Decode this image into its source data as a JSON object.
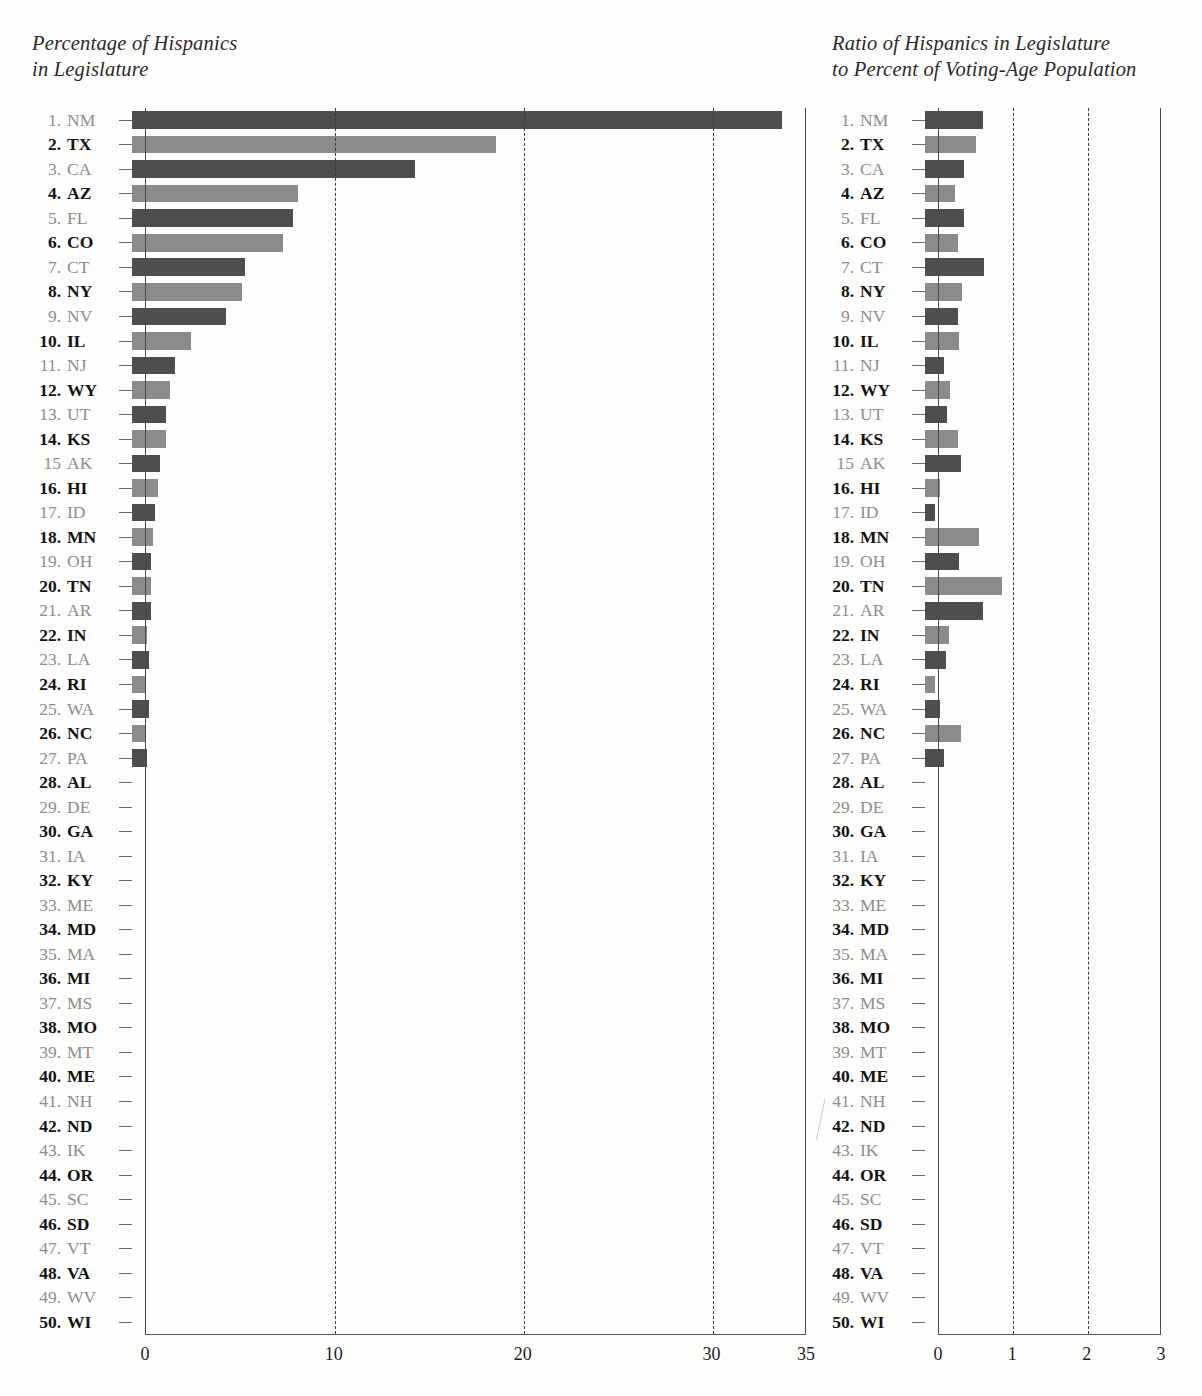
{
  "panels": {
    "left": {
      "title": "Percentage of Hispanics\nin Legislature"
    },
    "right": {
      "title": "Ratio of Hispanics in Legislature\nto Percent of Voting-Age Population"
    }
  },
  "rows": [
    {
      "rank": "1.",
      "abbr": "NM"
    },
    {
      "rank": "2.",
      "abbr": "TX"
    },
    {
      "rank": "3.",
      "abbr": "CA"
    },
    {
      "rank": "4.",
      "abbr": "AZ"
    },
    {
      "rank": "5.",
      "abbr": "FL"
    },
    {
      "rank": "6.",
      "abbr": "CO"
    },
    {
      "rank": "7.",
      "abbr": "CT"
    },
    {
      "rank": "8.",
      "abbr": "NY"
    },
    {
      "rank": "9.",
      "abbr": "NV"
    },
    {
      "rank": "10.",
      "abbr": "IL"
    },
    {
      "rank": "11.",
      "abbr": "NJ"
    },
    {
      "rank": "12.",
      "abbr": "WY"
    },
    {
      "rank": "13.",
      "abbr": "UT"
    },
    {
      "rank": "14.",
      "abbr": "KS"
    },
    {
      "rank": "15",
      "abbr": "AK"
    },
    {
      "rank": "16.",
      "abbr": "HI"
    },
    {
      "rank": "17.",
      "abbr": "ID"
    },
    {
      "rank": "18.",
      "abbr": "MN"
    },
    {
      "rank": "19.",
      "abbr": "OH"
    },
    {
      "rank": "20.",
      "abbr": "TN"
    },
    {
      "rank": "21.",
      "abbr": "AR"
    },
    {
      "rank": "22.",
      "abbr": "IN"
    },
    {
      "rank": "23.",
      "abbr": "LA"
    },
    {
      "rank": "24.",
      "abbr": "RI"
    },
    {
      "rank": "25.",
      "abbr": "WA"
    },
    {
      "rank": "26.",
      "abbr": "NC"
    },
    {
      "rank": "27.",
      "abbr": "PA"
    },
    {
      "rank": "28.",
      "abbr": "AL"
    },
    {
      "rank": "29.",
      "abbr": "DE"
    },
    {
      "rank": "30.",
      "abbr": "GA"
    },
    {
      "rank": "31.",
      "abbr": "IA"
    },
    {
      "rank": "32.",
      "abbr": "KY"
    },
    {
      "rank": "33.",
      "abbr": "ME"
    },
    {
      "rank": "34.",
      "abbr": "MD"
    },
    {
      "rank": "35.",
      "abbr": "MA"
    },
    {
      "rank": "36.",
      "abbr": "MI"
    },
    {
      "rank": "37.",
      "abbr": "MS"
    },
    {
      "rank": "38.",
      "abbr": "MO"
    },
    {
      "rank": "39.",
      "abbr": "MT"
    },
    {
      "rank": "40.",
      "abbr": "ME"
    },
    {
      "rank": "41.",
      "abbr": "NH"
    },
    {
      "rank": "42.",
      "abbr": "ND"
    },
    {
      "rank": "43.",
      "abbr": "IK"
    },
    {
      "rank": "44.",
      "abbr": "OR"
    },
    {
      "rank": "45.",
      "abbr": "SC"
    },
    {
      "rank": "46.",
      "abbr": "SD"
    },
    {
      "rank": "47.",
      "abbr": "VT"
    },
    {
      "rank": "48.",
      "abbr": "VA"
    },
    {
      "rank": "49.",
      "abbr": "WV"
    },
    {
      "rank": "50.",
      "abbr": "WI"
    }
  ],
  "colors": {
    "bar_dark": "#4e4e4e",
    "bar_light": "#8b8b8b",
    "axis": "#4a4a4a",
    "grid": "#3a3a3a",
    "label_dark": "#131313",
    "label_light": "#8d8d8d"
  },
  "chart_data": [
    {
      "type": "bar",
      "orientation": "horizontal",
      "title": "Percentage of Hispanics in Legislature",
      "xlabel": "",
      "ylabel": "",
      "xlim": [
        0,
        35
      ],
      "ticks": [
        0,
        10,
        20,
        30,
        35
      ],
      "tick_labels": [
        "0",
        "10",
        "20",
        "30",
        "35"
      ],
      "gridlines": [
        10,
        20,
        30
      ],
      "grid": true,
      "legend": "none",
      "categories": [
        "NM",
        "TX",
        "CA",
        "AZ",
        "FL",
        "CO",
        "CT",
        "NY",
        "NV",
        "IL",
        "NJ",
        "WY",
        "UT",
        "KS",
        "AK",
        "HI",
        "ID",
        "MN",
        "OH",
        "TN",
        "AR",
        "IN",
        "LA",
        "RI",
        "WA",
        "NC",
        "PA",
        "AL",
        "DE",
        "GA",
        "IA",
        "KY",
        "ME",
        "MD",
        "MA",
        "MI",
        "MS",
        "MO",
        "MT",
        "ME",
        "NH",
        "ND",
        "IK",
        "OR",
        "SC",
        "SD",
        "VT",
        "VA",
        "WV",
        "WI"
      ],
      "values": [
        34.4,
        19.3,
        15.0,
        8.8,
        8.5,
        8.0,
        6.0,
        5.8,
        5.0,
        3.1,
        2.3,
        2.0,
        1.8,
        1.8,
        1.5,
        1.4,
        1.2,
        1.1,
        1.0,
        1.0,
        1.0,
        0.8,
        0.9,
        0.7,
        0.9,
        0.7,
        0.8,
        0,
        0,
        0,
        0,
        0,
        0,
        0,
        0,
        0,
        0,
        0,
        0,
        0,
        0,
        0,
        0,
        0,
        0,
        0,
        0,
        0,
        0,
        0
      ]
    },
    {
      "type": "bar",
      "orientation": "horizontal",
      "title": "Ratio of Hispanics in Legislature to Percent of Voting-Age Population",
      "xlabel": "",
      "ylabel": "",
      "xlim": [
        0,
        3
      ],
      "ticks": [
        0,
        1,
        2,
        3
      ],
      "tick_labels": [
        "0",
        "1",
        "2",
        "3"
      ],
      "gridlines": [
        1,
        2
      ],
      "grid": true,
      "legend": "none",
      "categories": [
        "NM",
        "TX",
        "CA",
        "AZ",
        "FL",
        "CO",
        "CT",
        "NY",
        "NV",
        "IL",
        "NJ",
        "WY",
        "UT",
        "KS",
        "AK",
        "HI",
        "ID",
        "MN",
        "OH",
        "TN",
        "AR",
        "IN",
        "LA",
        "RI",
        "WA",
        "NC",
        "PA",
        "AL",
        "DE",
        "GA",
        "IA",
        "KY",
        "ME",
        "MD",
        "MA",
        "MI",
        "MS",
        "MO",
        "MT",
        "ME",
        "NH",
        "ND",
        "IK",
        "OR",
        "SC",
        "SD",
        "VT",
        "VA",
        "WV",
        "WI"
      ],
      "values": [
        0.78,
        0.68,
        0.52,
        0.4,
        0.52,
        0.45,
        0.8,
        0.5,
        0.44,
        0.46,
        0.26,
        0.34,
        0.3,
        0.44,
        0.48,
        0.2,
        0.13,
        0.72,
        0.46,
        1.04,
        0.78,
        0.32,
        0.28,
        0.14,
        0.2,
        0.49,
        0.26,
        0,
        0,
        0,
        0,
        0,
        0,
        0,
        0,
        0,
        0,
        0,
        0,
        0,
        0,
        0,
        0,
        0,
        0,
        0,
        0,
        0,
        0,
        0
      ]
    }
  ]
}
